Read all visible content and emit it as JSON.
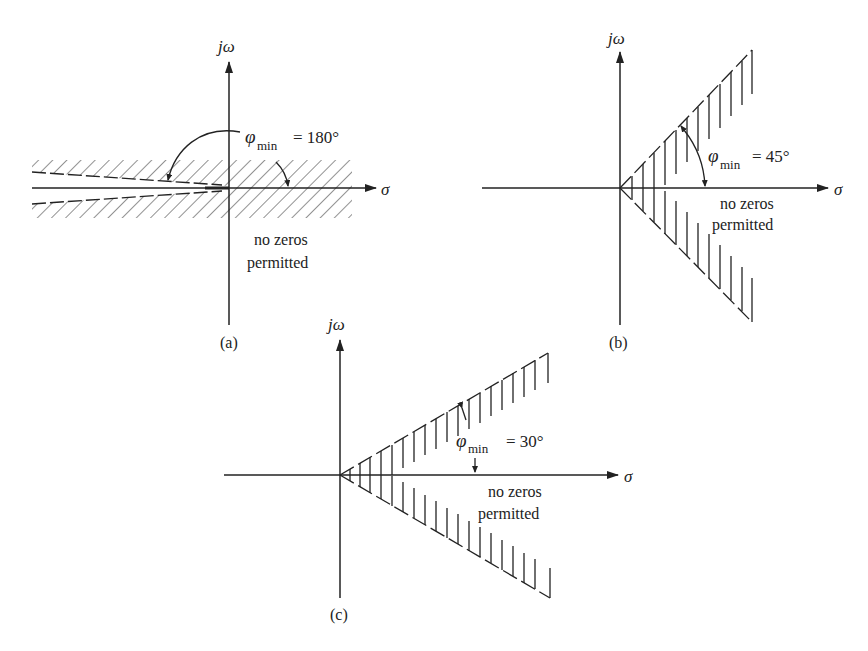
{
  "figure": {
    "panels": [
      {
        "id": "a",
        "caption": "(a)",
        "axis_imag": "jω",
        "axis_real": "σ",
        "phi_symbol": "φ",
        "phi_sub": "min",
        "phi_value": "= 180°",
        "note_line1": "no zeros",
        "note_line2": "permitted"
      },
      {
        "id": "b",
        "caption": "(b)",
        "axis_imag": "jω",
        "axis_real": "σ",
        "phi_symbol": "φ",
        "phi_sub": "min",
        "phi_value": "= 45°",
        "note_line1": "no zeros",
        "note_line2": "permitted"
      },
      {
        "id": "c",
        "caption": "(c)",
        "axis_imag": "jω",
        "axis_real": "σ",
        "phi_symbol": "φ",
        "phi_sub": "min",
        "phi_value": "= 30°",
        "note_line1": "no zeros",
        "note_line2": "permitted"
      }
    ]
  },
  "colors": {
    "ink": "#222222",
    "background": "#ffffff"
  }
}
